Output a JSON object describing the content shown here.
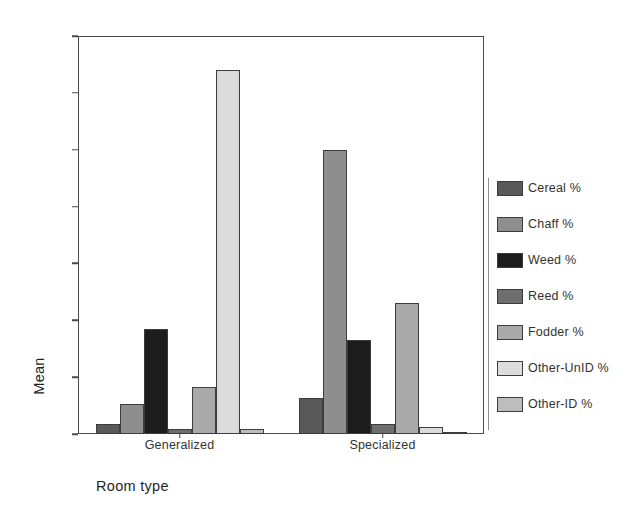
{
  "chart_data": {
    "type": "bar",
    "title": "",
    "subtitle": "",
    "xlabel": "Room type",
    "ylabel": "Mean",
    "categories": [
      "Generalized",
      "Specialized"
    ],
    "ylim": [
      0.0,
      0.7
    ],
    "yticks": [
      "0.0",
      ".1",
      ".2",
      ".3",
      ".4",
      ".5",
      ".6",
      ".7"
    ],
    "ytick_values": [
      0.0,
      0.1,
      0.2,
      0.3,
      0.4,
      0.5,
      0.6,
      0.7
    ],
    "grid": false,
    "legend_position": "right",
    "series": [
      {
        "name": "Cereal %",
        "color": "#595959",
        "values": [
          0.018,
          0.063
        ]
      },
      {
        "name": "Chaff %",
        "color": "#8e8e8e",
        "values": [
          0.053,
          0.5
        ]
      },
      {
        "name": "Weed %",
        "color": "#1c1c1c",
        "values": [
          0.185,
          0.166
        ]
      },
      {
        "name": "Reed %",
        "color": "#6e6e6e",
        "values": [
          0.009,
          0.017
        ]
      },
      {
        "name": "Fodder %",
        "color": "#a9a9a9",
        "values": [
          0.083,
          0.23
        ]
      },
      {
        "name": "Other-UnID %",
        "color": "#dcdcdc",
        "values": [
          0.641,
          0.013
        ]
      },
      {
        "name": "Other-ID %",
        "color": "#bdbdbd",
        "values": [
          0.008,
          0.004
        ]
      }
    ]
  },
  "axes": {
    "y_title": "Mean",
    "x_title": "Room type"
  },
  "colors": {
    "frame": "#4a4a4a",
    "background": "#ffffff",
    "text": "#333333"
  }
}
